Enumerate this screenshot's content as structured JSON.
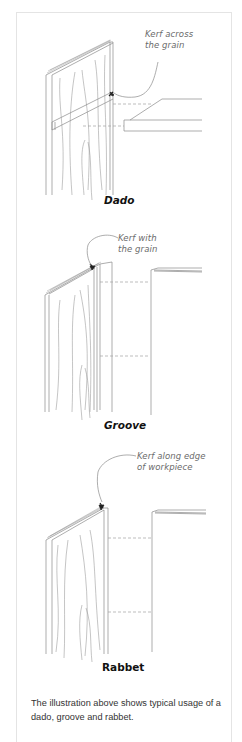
{
  "figure": {
    "panels": [
      {
        "id": "dado",
        "label": "Dado",
        "callout_line1": "Kerf across",
        "callout_line2": "the grain"
      },
      {
        "id": "groove",
        "label": "Groove",
        "callout_line1": "Kerf with",
        "callout_line2": "the grain"
      },
      {
        "id": "rabbet",
        "label": "Rabbet",
        "callout_line1": "Kerf along edge",
        "callout_line2": "of workpiece"
      }
    ],
    "caption": "The illustration above shows typical usage of a dado, groove and rabbet."
  },
  "colors": {
    "line": "#8a8a8a",
    "dash": "#a0a0a0",
    "frame": "#e4e4e4",
    "text": "#333333"
  }
}
